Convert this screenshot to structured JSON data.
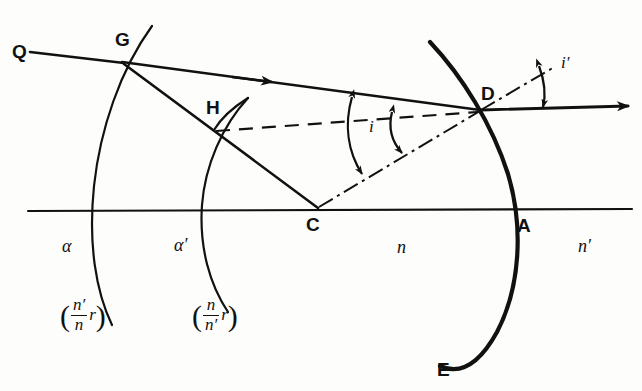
{
  "figure": {
    "domain_kind": "optics-ray-diagram",
    "canvas": {
      "width": 642,
      "height": 391
    },
    "ink_color": "#111111",
    "background_color": "#fdfdfb",
    "points": [
      {
        "id": "Q",
        "label": "Q",
        "x": 12,
        "y": 42
      },
      {
        "id": "G",
        "label": "G",
        "x": 115,
        "y": 45
      },
      {
        "id": "H",
        "label": "H",
        "x": 206,
        "y": 113
      },
      {
        "id": "C",
        "label": "C",
        "x": 310,
        "y": 224
      },
      {
        "id": "D",
        "label": "D",
        "x": 476,
        "y": 95
      },
      {
        "id": "A",
        "label": "A",
        "x": 515,
        "y": 225
      },
      {
        "id": "E",
        "label": "E",
        "x": 437,
        "y": 370
      }
    ],
    "arc_labels": [
      {
        "id": "alpha",
        "label": "α",
        "x": 82,
        "y": 243
      },
      {
        "id": "alpha-prime",
        "label": "α′",
        "x": 190,
        "y": 242
      }
    ],
    "medium_labels": [
      {
        "id": "n",
        "label": "n",
        "x": 397,
        "y": 245
      },
      {
        "id": "n-prime",
        "label": "n′",
        "x": 578,
        "y": 244
      }
    ],
    "angle_labels": [
      {
        "id": "i-inner-left",
        "label": "i",
        "x": 366,
        "y": 125
      },
      {
        "id": "i-prime-right",
        "label": "i′",
        "x": 566,
        "y": 60
      }
    ],
    "fractions": [
      {
        "id": "alpha-radius",
        "numerator": "n′",
        "denominator": "n",
        "tail": "r",
        "open_paren": "(",
        "close_paren": ")",
        "x": 60,
        "y": 300
      },
      {
        "id": "alpha-prime-radius",
        "numerator": "n",
        "denominator": "n′",
        "tail": "r",
        "open_paren": "(",
        "close_paren": ")",
        "x": 192,
        "y": 300
      }
    ]
  }
}
